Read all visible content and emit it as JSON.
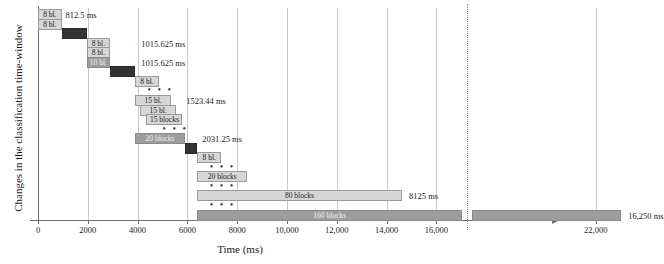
{
  "chart_data": {
    "type": "bar",
    "title": "",
    "xlabel": "Time (ms)",
    "ylabel": "Changes in the classification time-window",
    "orientation": "horizontal",
    "grid": true,
    "legend": false,
    "xlim": [
      0,
      24000
    ],
    "axis_break": {
      "after": 16000,
      "resume": 21000
    },
    "xticks": [
      "0",
      "2000",
      "4000",
      "6000",
      "8000",
      "10,000",
      "12,000",
      "14,000",
      "16,000",
      "22,000"
    ],
    "xtick_values": [
      0,
      2000,
      4000,
      6000,
      8000,
      10000,
      12000,
      14000,
      16000,
      22000
    ],
    "bars": [
      {
        "label": "8 bl.",
        "start": 0,
        "end": 950,
        "shade": "light",
        "row": 0
      },
      {
        "label": "8 bl.",
        "start": 0,
        "end": 950,
        "shade": "light",
        "row": 1
      },
      {
        "label": "",
        "start": 950,
        "end": 1950,
        "shade": "dark",
        "row": 2
      },
      {
        "label": "8 bl.",
        "start": 1950,
        "end": 2900,
        "shade": "light",
        "row": 3
      },
      {
        "label": "8 bl.",
        "start": 1950,
        "end": 2900,
        "shade": "light",
        "row": 4
      },
      {
        "label": "10 bl.",
        "start": 1950,
        "end": 2900,
        "shade": "mid",
        "row": 5
      },
      {
        "label": "",
        "start": 2900,
        "end": 3900,
        "shade": "dark",
        "row": 6
      },
      {
        "label": "8 bl.",
        "start": 3900,
        "end": 4850,
        "shade": "light",
        "row": 7
      },
      {
        "label": "15 bl.",
        "start": 3900,
        "end": 5350,
        "shade": "light",
        "row": 9
      },
      {
        "label": "15 bl.",
        "start": 4100,
        "end": 5550,
        "shade": "light",
        "row": 10
      },
      {
        "label": "15 blocks",
        "start": 4350,
        "end": 5800,
        "shade": "light",
        "row": 11
      },
      {
        "label": "20 blocks",
        "start": 3900,
        "end": 5900,
        "shade": "mid",
        "row": 13
      },
      {
        "label": "",
        "start": 5900,
        "end": 6400,
        "shade": "dark",
        "row": 14
      },
      {
        "label": "8 bl.",
        "start": 6400,
        "end": 7350,
        "shade": "light",
        "row": 15
      },
      {
        "label": "20 blocks",
        "start": 6400,
        "end": 8400,
        "shade": "light",
        "row": 17
      },
      {
        "label": "80 blocks",
        "start": 6400,
        "end": 14600,
        "shade": "light",
        "row": 19
      },
      {
        "label": "160 blocks",
        "start": 6400,
        "end": 23000,
        "shade": "mid",
        "row": 21
      }
    ],
    "annotations": [
      {
        "text": "812.5 ms",
        "at": 1100,
        "row": 0
      },
      {
        "text": "1015.625 ms",
        "at": 4150,
        "row": 3
      },
      {
        "text": "1015.625 ms",
        "at": 4150,
        "row": 5
      },
      {
        "text": "1523.44 ms",
        "at": 5950,
        "row": 9
      },
      {
        "text": "2031.25 ms",
        "at": 6600,
        "row": 13
      },
      {
        "text": "8125 ms",
        "at": 14900,
        "row": 19
      },
      {
        "text": "16,250 ms",
        "at": 23300,
        "row": 21
      }
    ],
    "ellipses": [
      {
        "at": 4400,
        "row": 8
      },
      {
        "at": 5000,
        "row": 12
      },
      {
        "at": 6900,
        "row": 16
      },
      {
        "at": 6900,
        "row": 18
      },
      {
        "at": 6900,
        "row": 20
      }
    ]
  }
}
